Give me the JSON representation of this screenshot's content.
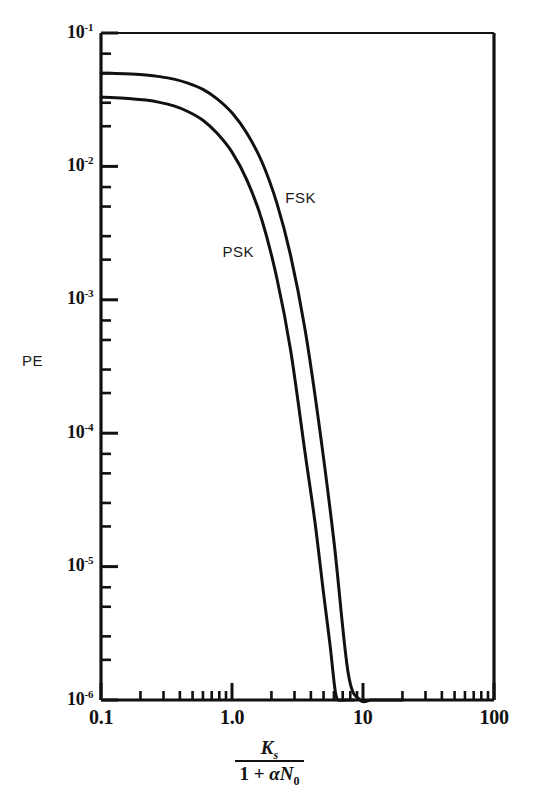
{
  "figure": {
    "name": "pe-vs-normalized-signal-ratio-plot",
    "background_color": "#ffffff",
    "ink_color": "#111111"
  },
  "chart_data": {
    "type": "line",
    "title": "",
    "subtitle": "",
    "xlabel_parts": {
      "numerator": "K",
      "numerator_sub": "s",
      "denominator_prefix": "1 + ",
      "denominator_alpha": "α",
      "denominator_N": "N",
      "denominator_sub": "0"
    },
    "xlabel_plain": "Ks / (1 + αN0)",
    "ylabel": "PE",
    "xscale": "log",
    "yscale": "log",
    "xlim": [
      0.1,
      100
    ],
    "ylim": [
      1e-06,
      0.1
    ],
    "grid": false,
    "legend_position": "inline-curve-labels",
    "x_tick_labels": [
      "0.1",
      "1.0",
      "10",
      "100"
    ],
    "x_tick_values": [
      0.1,
      1.0,
      10,
      100
    ],
    "y_tick_labels": [
      "10⁻¹",
      "10⁻²",
      "10⁻³",
      "10⁻⁴",
      "10⁻⁵",
      "10⁻⁶"
    ],
    "y_tick_mantissas": [
      "10",
      "10",
      "10",
      "10",
      "10",
      "10"
    ],
    "y_tick_exponents": [
      "-1",
      "-2",
      "-3",
      "-4",
      "-5",
      "-6"
    ],
    "y_tick_values": [
      0.1,
      0.01,
      0.001,
      0.0001,
      1e-05,
      1e-06
    ],
    "minor_ticks": true,
    "series": [
      {
        "name": "PSK",
        "label": "PSK",
        "label_x": 1.12,
        "label_y": 0.0023,
        "color": "#111111",
        "line_width": 3,
        "x": [
          0.1,
          0.13,
          0.17,
          0.22,
          0.28,
          0.36,
          0.46,
          0.6,
          0.77,
          1.0,
          1.3,
          1.7,
          2.2,
          2.8,
          3.6,
          4.3,
          5.0,
          5.6,
          6.2,
          6.8,
          7.3,
          7.8,
          8.2,
          8.5
        ],
        "y": [
          0.033,
          0.0327,
          0.0322,
          0.0314,
          0.0302,
          0.0284,
          0.0258,
          0.0222,
          0.0177,
          0.0128,
          0.0079,
          0.0039,
          0.00145,
          0.00042,
          7.3e-05,
          2.15e-05,
          6.3e-06,
          2.6e-06,
          1.1e-06,
          4.6e-07,
          2.4e-07,
          1.4e-07,
          1e-07,
          1e-06
        ]
      },
      {
        "name": "FSK",
        "label": "FSK",
        "label_x": 3.35,
        "label_y": 0.0058,
        "color": "#111111",
        "line_width": 3,
        "x": [
          0.1,
          0.13,
          0.17,
          0.22,
          0.28,
          0.36,
          0.46,
          0.6,
          0.77,
          1.0,
          1.3,
          1.7,
          2.2,
          2.8,
          3.6,
          4.6,
          6.0,
          7.7,
          9.5,
          11.5,
          13.5,
          15.5,
          17.5,
          19.0,
          20.0
        ],
        "y": [
          0.05,
          0.0497,
          0.0492,
          0.0484,
          0.0471,
          0.0451,
          0.0421,
          0.0378,
          0.0321,
          0.0252,
          0.0177,
          0.0107,
          0.0053,
          0.00215,
          0.00061,
          0.00012,
          1.55e-05,
          1.6e-06,
          2.2e-07,
          4e-08,
          2e-08,
          1e-08,
          5e-09,
          2e-09,
          1e-06
        ]
      }
    ]
  }
}
